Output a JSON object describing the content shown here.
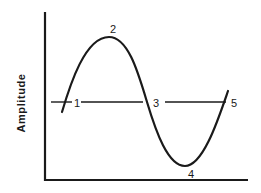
{
  "diagram": {
    "type": "waveform",
    "ylabel": "Amplitude",
    "xlabel": "",
    "point_labels": [
      {
        "id": "1",
        "label": "1",
        "description": "zero crossing (start)"
      },
      {
        "id": "2",
        "label": "2",
        "description": "positive peak"
      },
      {
        "id": "3",
        "label": "3",
        "description": "zero crossing (middle)"
      },
      {
        "id": "4",
        "label": "4",
        "description": "negative trough"
      },
      {
        "id": "5",
        "label": "5",
        "description": "zero crossing (end)"
      }
    ],
    "colors": {
      "line": "#1a1a1a",
      "background": "#ffffff"
    }
  }
}
